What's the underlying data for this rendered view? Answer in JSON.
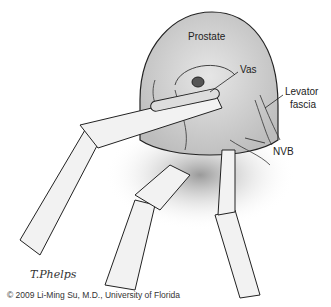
{
  "figure": {
    "labels": {
      "prostate": "Prostate",
      "vas": "Vas",
      "levator": "Levator",
      "fascia": "fascia",
      "nvb": "NVB"
    },
    "signature": "T.Phelps",
    "credit": "© 2009 Li-Ming Su, M.D., University of Florida"
  }
}
